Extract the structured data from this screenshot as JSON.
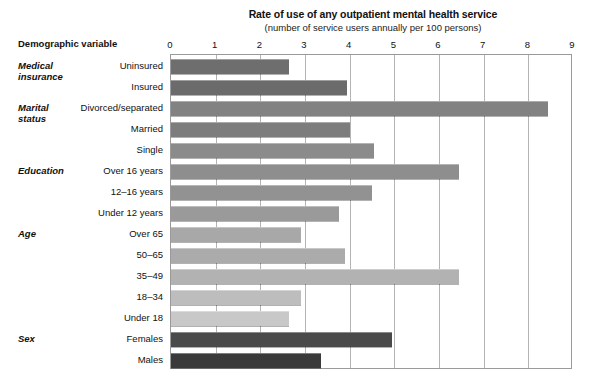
{
  "header": {
    "title": "Rate of use of any outpatient mental health service",
    "subtitle": "(number of service users annually per 100 persons)",
    "axis_caption": "Demographic variable"
  },
  "chart_data": {
    "type": "bar",
    "orientation": "horizontal",
    "title": "Rate of use of any outpatient mental health service",
    "subtitle": "(number of service users annually per 100 persons)",
    "xlabel": "number of service users annually per 100 persons",
    "ylabel": "Demographic variable",
    "xlim": [
      0,
      9
    ],
    "xticks": [
      0,
      1,
      2,
      3,
      4,
      5,
      6,
      7,
      8,
      9
    ],
    "xtick_labels": [
      "0",
      "1",
      "2",
      "3",
      "4",
      "5",
      "6",
      "7",
      "8",
      "9"
    ],
    "grid": true,
    "grid_axis": "x",
    "legend": "none",
    "categories": [
      "Uninsured",
      "Insured",
      "Divorced/separated",
      "Married",
      "Single",
      "Over 16 years",
      "12–16 years",
      "Under 12 years",
      "Over 65",
      "50–65",
      "35–49",
      "18–34",
      "Under 18",
      "Females",
      "Males"
    ],
    "values": [
      2.65,
      3.95,
      8.45,
      4.0,
      4.55,
      6.45,
      4.5,
      3.75,
      2.9,
      3.9,
      6.45,
      2.9,
      2.65,
      4.95,
      3.35
    ],
    "bar_colors": [
      "#6e6e6e",
      "#6b6b6b",
      "#828282",
      "#7d7d7d",
      "#8b8b8b",
      "#8e8e8e",
      "#929292",
      "#9a9a9a",
      "#a8a8a8",
      "#ababab",
      "#b2b2b2",
      "#bdbdbd",
      "#c8c8c8",
      "#4a4a4a",
      "#3a3a3a"
    ],
    "groups": [
      {
        "label": "Medical\ninsurance",
        "start_index": 0,
        "count": 2
      },
      {
        "label": "Marital\nstatus",
        "start_index": 2,
        "count": 3
      },
      {
        "label": "Education",
        "start_index": 5,
        "count": 3
      },
      {
        "label": "Age",
        "start_index": 8,
        "count": 5
      },
      {
        "label": "Sex",
        "start_index": 13,
        "count": 2
      }
    ]
  },
  "colors": {
    "frame": "#9a9a9a",
    "gridline": "#b4b4b4",
    "background": "#ffffff",
    "text": "#111111"
  }
}
